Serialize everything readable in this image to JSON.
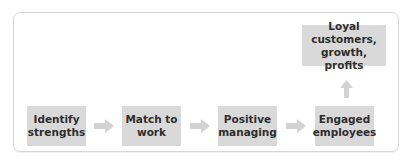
{
  "diagram": {
    "steps": [
      {
        "id": "identify",
        "line1": "Identify",
        "line2": "strengths"
      },
      {
        "id": "match",
        "line1": "Match to",
        "line2": "work"
      },
      {
        "id": "positive",
        "line1": "Positive",
        "line2": "managing"
      },
      {
        "id": "engaged",
        "line1": "Engaged",
        "line2": "employees"
      }
    ],
    "outcome": {
      "line1": "Loyal customers,",
      "line2": "growth, profits"
    },
    "colors": {
      "box_fill": "#d9d9d9",
      "arrow_fill": "#d3d3d3",
      "text": "#2e2e2e",
      "frame": "#d6d6d6"
    },
    "arrows": [
      {
        "from": "Identify strengths",
        "to": "Match to work",
        "direction": "right"
      },
      {
        "from": "Match to work",
        "to": "Positive managing",
        "direction": "right"
      },
      {
        "from": "Positive managing",
        "to": "Engaged employees",
        "direction": "right"
      },
      {
        "from": "Engaged employees",
        "to": "Loyal customers, growth, profits",
        "direction": "up"
      }
    ]
  }
}
